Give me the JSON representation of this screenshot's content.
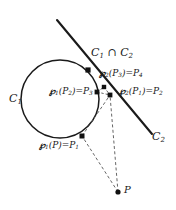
{
  "figure": {
    "type": "geometry-diagram",
    "background_color": "#ffffff",
    "stroke_color": "#1a1a1a",
    "dashed_color": "#555555",
    "point_color": "#111111",
    "width": 176,
    "height": 210
  },
  "curves": {
    "circle": {
      "name": "C1",
      "label": "C",
      "label_sub": "1",
      "cx": 60,
      "cy": 99,
      "r": 39,
      "label_x": 9,
      "label_y": 98
    },
    "line": {
      "name": "C2",
      "label": "C",
      "label_sub": "2",
      "x1": 57,
      "y1": 20,
      "x2": 152,
      "y2": 134,
      "label_x": 152,
      "label_y": 136
    }
  },
  "intersection": {
    "label_main": "C",
    "label_sub1": "1",
    "operator": " ∩ ",
    "label_main2": "C",
    "label_sub2": "2",
    "point_x": 88,
    "point_y": 70,
    "label_x": 92,
    "label_y": 53
  },
  "points": [
    {
      "name": "P1",
      "id": "point-p1",
      "x": 82,
      "y": 136,
      "label_prefix": "℘",
      "label_prefix_sub": "1",
      "label_arg": "(P)=P",
      "label_arg_sub": "1",
      "label_x": 41,
      "label_y": 146
    },
    {
      "name": "P3",
      "id": "point-p3",
      "x": 97,
      "y": 92,
      "label_prefix": "℘",
      "label_prefix_sub": "1",
      "label_arg": "(P",
      "label_arg_sub": "2",
      "label_tail": ")=P",
      "label_tail_sub": "3",
      "label_x": 52,
      "label_y": 92
    },
    {
      "name": "P4",
      "id": "point-p4",
      "x": 104,
      "y": 87,
      "label_prefix": "℘",
      "label_prefix_sub": "2",
      "label_arg": "(P",
      "label_arg_sub": "3",
      "label_tail": ")=P",
      "label_tail_sub": "4",
      "label_x": 99,
      "label_y": 74
    },
    {
      "name": "P2",
      "id": "point-p2",
      "x": 110,
      "y": 95,
      "label_prefix": "℘",
      "label_prefix_sub": "2",
      "label_arg": "(P",
      "label_arg_sub": "1",
      "label_tail": ")=P",
      "label_tail_sub": "2",
      "label_x": 120,
      "label_y": 92
    },
    {
      "name": "P",
      "id": "point-p",
      "x": 118,
      "y": 192,
      "label_prefix": "P",
      "label_x": 124,
      "label_y": 189
    }
  ],
  "dashed_paths": [
    {
      "name": "p-to-p1",
      "from": "P",
      "to": "P1",
      "x1": 118,
      "y1": 192,
      "x2": 82,
      "y2": 136
    },
    {
      "name": "p-to-p2",
      "from": "P",
      "to": "P2",
      "x1": 118,
      "y1": 192,
      "x2": 110,
      "y2": 95
    },
    {
      "name": "p1-to-p2",
      "from": "P1",
      "to": "P2",
      "x1": 82,
      "y1": 136,
      "x2": 110,
      "y2": 95
    },
    {
      "name": "p3-to-p2",
      "from": "P3",
      "to": "P2",
      "x1": 97,
      "y1": 92,
      "x2": 110,
      "y2": 95
    },
    {
      "name": "p3-to-p4",
      "from": "P3",
      "to": "P4",
      "x1": 97,
      "y1": 92,
      "x2": 104,
      "y2": 87
    },
    {
      "name": "p4-to-p2",
      "from": "P4",
      "to": "P2",
      "x1": 104,
      "y1": 87,
      "x2": 110,
      "y2": 95
    }
  ]
}
